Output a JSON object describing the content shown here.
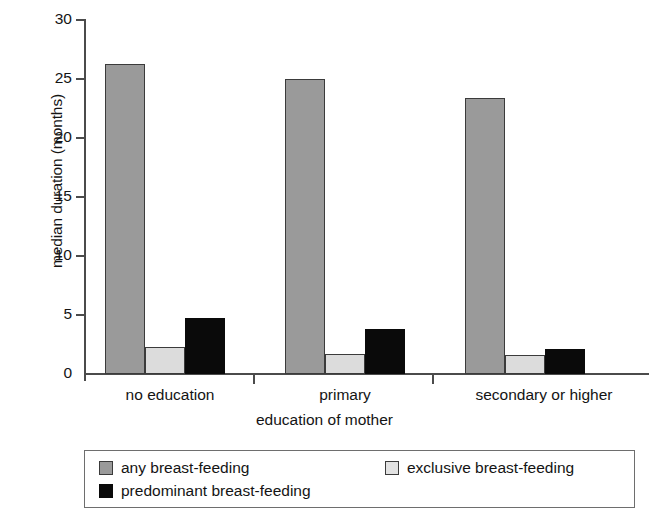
{
  "chart_data": {
    "type": "bar",
    "title": "",
    "xlabel": "education of mother",
    "ylabel": "median duration (months)",
    "categories": [
      "no education",
      "primary",
      "secondary or higher"
    ],
    "series": [
      {
        "name": "any breast-feeding",
        "color": "#9a9a9a",
        "values": [
          26.2,
          24.9,
          23.3
        ]
      },
      {
        "name": "exclusive breast-feeding",
        "color": "#dcdcdc",
        "values": [
          2.3,
          1.7,
          1.6
        ]
      },
      {
        "name": "predominant breast-feeding",
        "color": "#0a0a0a",
        "values": [
          4.7,
          3.8,
          2.1
        ]
      }
    ],
    "ylim": [
      0,
      30
    ],
    "yticks": [
      0,
      5,
      10,
      15,
      20,
      25,
      30
    ],
    "ytick_labels": [
      "0",
      "5",
      "10",
      "15",
      "20",
      "25",
      "30"
    ],
    "grid": false,
    "legend_position": "bottom"
  },
  "axis": {
    "y_title": "median duration (months)",
    "x_title": "education of mother",
    "tick_30": "30",
    "tick_25": "25",
    "tick_20": "20",
    "tick_15": "15",
    "tick_10": "10",
    "tick_5": "5",
    "tick_0": "0",
    "cat_0": "no education",
    "cat_1": "primary",
    "cat_2": "secondary or higher"
  },
  "legend": {
    "items": [
      {
        "label": "any breast-feeding"
      },
      {
        "label": "exclusive breast-feeding"
      },
      {
        "label": "predominant breast-feeding"
      }
    ]
  }
}
